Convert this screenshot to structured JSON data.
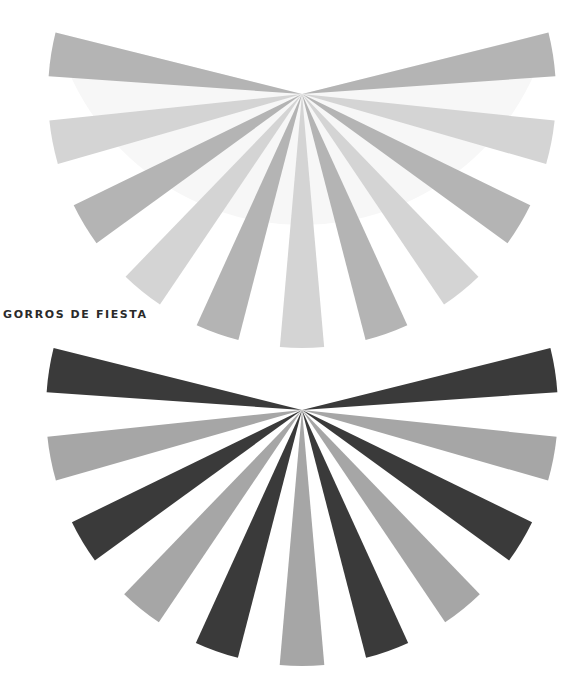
{
  "title": "GORROS DE FIESTA",
  "fans": [
    {
      "name": "top-fan",
      "center": [
        302,
        94
      ],
      "radius": 254,
      "ray_angles_deg": [
        189,
        169,
        149,
        129,
        109.5,
        90,
        70.5,
        51,
        31,
        11,
        -9
      ],
      "ray_width_deg": 10,
      "colors": [
        "#b4b4b4",
        "#d4d4d4",
        "#b4b4b4",
        "#d4d4d4",
        "#b4b4b4",
        "#d4d4d4",
        "#b4b4b4",
        "#d4d4d4",
        "#b4b4b4",
        "#d4d4d4",
        "#b4b4b4"
      ],
      "background_wedge_color": "#f7f7f7"
    },
    {
      "name": "bottom-fan",
      "center": [
        302,
        410
      ],
      "radius": 256,
      "ray_angles_deg": [
        189,
        169,
        149,
        129,
        109.5,
        90,
        70.5,
        51,
        31,
        11,
        -9
      ],
      "ray_width_deg": 10,
      "colors": [
        "#3a3a3a",
        "#a6a6a6",
        "#3a3a3a",
        "#a6a6a6",
        "#3a3a3a",
        "#a6a6a6",
        "#3a3a3a",
        "#a6a6a6",
        "#3a3a3a",
        "#a6a6a6",
        "#3a3a3a"
      ],
      "background_wedge_color": "#ffffff"
    }
  ]
}
